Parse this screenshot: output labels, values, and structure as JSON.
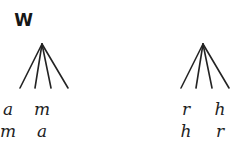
{
  "figure": {
    "background_color": "#ffffff",
    "stroke_color": "#232323",
    "text_color": "#1c1c1c"
  },
  "trees": [
    {
      "id": "tree-w",
      "label": "W",
      "branch_count": 4,
      "leaf_rows": [
        [
          "a",
          "m"
        ],
        [
          "m",
          "a"
        ]
      ]
    },
    {
      "id": "tree-x",
      "label": "X",
      "branch_count": 4,
      "leaf_rows": [
        [
          "r",
          "h"
        ],
        [
          "h",
          "r"
        ]
      ]
    }
  ]
}
